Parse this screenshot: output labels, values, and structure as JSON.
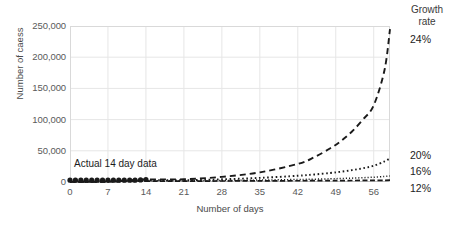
{
  "chart_data": {
    "type": "line",
    "title": "",
    "xlabel": "Number of days",
    "ylabel": "Number of caess",
    "xlim": [
      0,
      59
    ],
    "ylim": [
      0,
      250000
    ],
    "grid": true,
    "legend_position": "right",
    "legend_title_line1": "Growth",
    "legend_title_line2": "rate",
    "x_ticks": [
      "0",
      "7",
      "14",
      "21",
      "28",
      "35",
      "42",
      "49",
      "56"
    ],
    "x_tick_values": [
      0,
      7,
      14,
      21,
      28,
      35,
      42,
      49,
      56
    ],
    "y_ticks": [
      "0",
      "50,000",
      "100,000",
      "150,000",
      "200,000",
      "250,000"
    ],
    "y_tick_values": [
      0,
      50000,
      100000,
      150000,
      200000,
      250000
    ],
    "annotations": [
      {
        "text": "Actual 14 day data",
        "x": 1,
        "y": 30000
      }
    ],
    "series": [
      {
        "name": "24%",
        "label": "24%",
        "style": "dashed",
        "color": "#1a1a1a",
        "x": [
          0,
          7,
          14,
          21,
          28,
          35,
          42,
          45,
          48,
          50,
          52,
          54,
          56,
          58,
          59
        ],
        "values": [
          200,
          900,
          4000,
          4400,
          8200,
          15500,
          29000,
          39500,
          54000,
          66000,
          81000,
          100000,
          123000,
          180000,
          245000
        ]
      },
      {
        "name": "20%",
        "label": "20%",
        "style": "dotted",
        "color": "#1a1a1a",
        "x": [
          0,
          7,
          14,
          21,
          28,
          35,
          42,
          45,
          48,
          50,
          52,
          54,
          56,
          58,
          59
        ],
        "values": [
          200,
          700,
          2600,
          2800,
          4300,
          6600,
          10000,
          12000,
          14500,
          16500,
          19000,
          22000,
          26000,
          33000,
          38000
        ]
      },
      {
        "name": "16%",
        "label": "16%",
        "style": "dotted-fine",
        "color": "#1a1a1a",
        "x": [
          0,
          7,
          14,
          21,
          28,
          35,
          42,
          45,
          48,
          50,
          52,
          54,
          56,
          58,
          59
        ],
        "values": [
          200,
          500,
          1800,
          1900,
          2400,
          3100,
          4000,
          4500,
          5100,
          5600,
          6200,
          6900,
          7700,
          9000,
          9800
        ]
      },
      {
        "name": "12%",
        "label": "12%",
        "style": "dash-dot",
        "color": "#1a1a1a",
        "x": [
          0,
          7,
          14,
          21,
          28,
          35,
          42,
          45,
          48,
          50,
          52,
          54,
          56,
          58,
          59
        ],
        "values": [
          200,
          400,
          1400,
          1450,
          1600,
          1800,
          2000,
          2100,
          2200,
          2300,
          2400,
          2500,
          2600,
          2750,
          2850
        ]
      },
      {
        "name": "Actual 14 day data",
        "label": "Actual 14 day data",
        "style": "markers",
        "color": "#1a1a1a",
        "x": [
          0,
          1,
          2,
          3,
          4,
          5,
          6,
          7,
          8,
          9,
          10,
          11,
          12,
          13,
          14
        ],
        "values": [
          100,
          150,
          220,
          320,
          450,
          600,
          780,
          980,
          1250,
          1550,
          1900,
          2300,
          2800,
          3350,
          4000
        ]
      }
    ],
    "legend_entries": [
      {
        "label": "24%",
        "y_position": 230000
      },
      {
        "label": "20%",
        "y_position": 44000
      },
      {
        "label": "16%",
        "y_position": 18000
      },
      {
        "label": "12%",
        "y_position": -10000
      }
    ]
  }
}
